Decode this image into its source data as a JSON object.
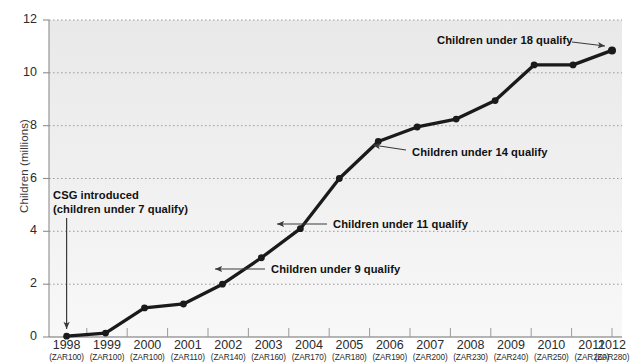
{
  "chart_data": {
    "type": "line",
    "title": "",
    "subtitle": "",
    "xlabel": "",
    "ylabel": "Children (millions)",
    "ylim": [
      0,
      12
    ],
    "yticks": [
      0,
      2,
      4,
      6,
      8,
      10,
      12
    ],
    "grid": true,
    "legend": "none",
    "categories": [
      "1998",
      "1999",
      "2000",
      "2001",
      "2002",
      "2003",
      "2004",
      "2005",
      "2006",
      "2007",
      "2008",
      "2009",
      "2010",
      "2011",
      "2012"
    ],
    "sublabels": [
      "(ZAR100)",
      "(ZAR100)",
      "(ZAR100)",
      "(ZAR110)",
      "(ZAR140)",
      "(ZAR160)",
      "(ZAR170)",
      "(ZAR180)",
      "(ZAR190)",
      "(ZAR200)",
      "(ZAR230)",
      "(ZAR240)",
      "(ZAR250)",
      "(ZAR260)",
      "(ZAR280)"
    ],
    "series": [
      {
        "name": "Children receiving CSG",
        "values": [
          0.03,
          0.15,
          1.1,
          1.25,
          2.0,
          3.0,
          4.1,
          6.0,
          7.4,
          7.95,
          8.25,
          8.95,
          10.3,
          10.3,
          10.85
        ]
      }
    ],
    "annotations": [
      {
        "id": "csg-introduced",
        "text_line1": "CSG introduced",
        "text_line2": "(children under 7 qualify)",
        "points_to_category": "1998"
      },
      {
        "id": "under-9",
        "text": "Children under 9 qualify",
        "points_to_category": "2003"
      },
      {
        "id": "under-11",
        "text": "Children under 11 qualify",
        "points_to_category": "2004"
      },
      {
        "id": "under-14",
        "text": "Children under 14 qualify",
        "points_to_category": "2006"
      },
      {
        "id": "under-18",
        "text": "Children under 18 qualify",
        "points_to_category": "2012"
      }
    ]
  },
  "axis": {
    "y_labels": [
      "12",
      "10",
      "8",
      "6",
      "4",
      "2",
      "0"
    ],
    "y_title": "Children (millions)"
  },
  "x_axis": [
    {
      "year": "1998",
      "zar": "(ZAR100)"
    },
    {
      "year": "1999",
      "zar": "(ZAR100)"
    },
    {
      "year": "2000",
      "zar": "(ZAR100)"
    },
    {
      "year": "2001",
      "zar": "(ZAR110)"
    },
    {
      "year": "2002",
      "zar": "(ZAR140)"
    },
    {
      "year": "2003",
      "zar": "(ZAR160)"
    },
    {
      "year": "2004",
      "zar": "(ZAR170)"
    },
    {
      "year": "2005",
      "zar": "(ZAR180)"
    },
    {
      "year": "2006",
      "zar": "(ZAR190)"
    },
    {
      "year": "2007",
      "zar": "(ZAR200)"
    },
    {
      "year": "2008",
      "zar": "(ZAR230)"
    },
    {
      "year": "2009",
      "zar": "(ZAR240)"
    },
    {
      "year": "2010",
      "zar": "(ZAR250)"
    },
    {
      "year": "2011",
      "zar": "(ZAR260)"
    },
    {
      "year": "2012",
      "zar": "(ZAR280)"
    }
  ],
  "annotations": {
    "csg_line1": "CSG introduced",
    "csg_line2": "(children under 7 qualify)",
    "under9": "Children under 9 qualify",
    "under11": "Children under 11 qualify",
    "under14": "Children under 14 qualify",
    "under18": "Children under 18 qualify"
  },
  "colors": {
    "line": "#1a1a1a",
    "grid": "#9a9a9a",
    "axis": "#8d8d8d",
    "plot_background_top": "#ececec",
    "plot_background_bottom": "#f7f7f7",
    "text": "#231f20"
  }
}
